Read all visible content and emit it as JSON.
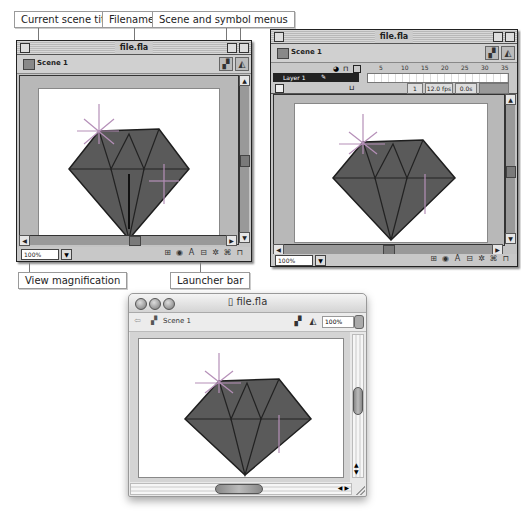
{
  "callouts": {
    "current_scene_title": "Current scene title",
    "filename": "Filename",
    "scene_symbol_menus": "Scene and symbol menus",
    "view_magnification": "View magnification",
    "launcher_bar": "Launcher bar"
  },
  "window_classic": {
    "title": "file.fla",
    "scene_label": "Scene 1",
    "magnification": "100%",
    "launcher_icons": [
      "info-icon",
      "transform-icon",
      "text-icon",
      "align-icon",
      "mixer-icon",
      "instance-icon",
      "library-icon"
    ],
    "launcher_glyphs": [
      "⊞",
      "◉",
      "A",
      "⊟",
      "✲",
      "⌘",
      "⊓"
    ]
  },
  "window_timeline": {
    "title": "file.fla",
    "scene_label": "Scene 1",
    "layer_name": "Layer 1",
    "ruler_ticks": [
      "5",
      "10",
      "15",
      "20",
      "25",
      "30",
      "35"
    ],
    "current_frame": "1",
    "frame_rate": "12.0 fps",
    "elapsed_time": "0.0s",
    "magnification": "100%",
    "launcher_glyphs": [
      "⊞",
      "◉",
      "A",
      "⊟",
      "✲",
      "⌘",
      "⊓"
    ]
  },
  "window_aqua": {
    "title": "file.fla",
    "scene_label": "Scene 1",
    "magnification": "100%"
  },
  "colors": {
    "diamond_fill": "#5a5a5a",
    "diamond_edge": "#1e1e1e",
    "window_gray": "#c4c4c4"
  }
}
